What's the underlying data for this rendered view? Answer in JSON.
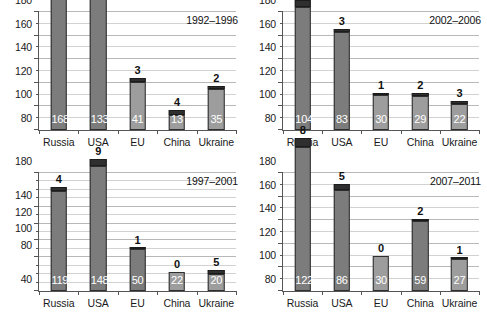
{
  "chart_data": {
    "type": "bar",
    "layout": "2x2 grid of stacked bar charts",
    "categories": [
      "Russia",
      "USA",
      "EU",
      "China",
      "Ukraine"
    ],
    "series_names": [
      "lower",
      "upper"
    ],
    "grid": true,
    "legend": "none",
    "panels": [
      {
        "id": "panel-tl",
        "title": "1992–1996",
        "position": "top-left",
        "ylim": [
          80,
          180
        ],
        "yticks": [
          80,
          100,
          120,
          140,
          160,
          180
        ],
        "ytick_labels": [
          "80",
          "100",
          "120",
          "140",
          "160",
          "180"
        ],
        "minor_step": 10,
        "bars": [
          {
            "category": "Russia",
            "lower": 168,
            "upper": 7,
            "total": 175,
            "light": false
          },
          {
            "category": "USA",
            "lower": 133,
            "upper": 11,
            "total": 144,
            "light": false
          },
          {
            "category": "EU",
            "lower": 41,
            "upper": 3,
            "total": 44,
            "light": true
          },
          {
            "category": "China",
            "lower": 13,
            "upper": 4,
            "total": 17,
            "light": true
          },
          {
            "category": "Ukraine",
            "lower": 35,
            "upper": 2,
            "total": 37,
            "light": true
          }
        ]
      },
      {
        "id": "panel-tr",
        "title": "2002–2006",
        "position": "top-right",
        "ylim": [
          80,
          180
        ],
        "yticks": [
          80,
          100,
          120,
          140,
          160,
          180
        ],
        "ytick_labels": [
          "80",
          "100",
          "120",
          "140",
          "160",
          "180"
        ],
        "minor_step": 10,
        "bars": [
          {
            "category": "Russia",
            "lower": 104,
            "upper": 6,
            "total": 110,
            "light": false
          },
          {
            "category": "USA",
            "lower": 83,
            "upper": 3,
            "total": 86,
            "light": false
          },
          {
            "category": "EU",
            "lower": 30,
            "upper": 1,
            "total": 31,
            "light": true
          },
          {
            "category": "China",
            "lower": 29,
            "upper": 2,
            "total": 31,
            "light": true
          },
          {
            "category": "Ukraine",
            "lower": 22,
            "upper": 3,
            "total": 25,
            "light": true
          }
        ]
      },
      {
        "id": "panel-bl",
        "title": "1997–2001",
        "position": "bottom-left",
        "ylim": [
          40,
          180
        ],
        "yticks": [
          40,
          80,
          100,
          120,
          140,
          180
        ],
        "ytick_labels": [
          "40",
          "80",
          "100",
          "120",
          "140",
          "180"
        ],
        "minor_step": 10,
        "bars": [
          {
            "category": "Russia",
            "lower": 119,
            "upper": 4,
            "total": 123,
            "light": false
          },
          {
            "category": "USA",
            "lower": 148,
            "upper": 9,
            "total": 157,
            "light": false
          },
          {
            "category": "EU",
            "lower": 50,
            "upper": 1,
            "total": 51,
            "light": false
          },
          {
            "category": "China",
            "lower": 22,
            "upper": 0,
            "total": 22,
            "light": true
          },
          {
            "category": "Ukraine",
            "lower": 20,
            "upper": 5,
            "total": 25,
            "light": true
          }
        ]
      },
      {
        "id": "panel-br",
        "title": "2007–2011",
        "position": "bottom-right",
        "ylim": [
          80,
          180
        ],
        "yticks": [
          80,
          100,
          120,
          140,
          160,
          180
        ],
        "ytick_labels": [
          "80",
          "100",
          "120",
          "140",
          "160",
          "180"
        ],
        "minor_step": 10,
        "bars": [
          {
            "category": "Russia",
            "lower": 122,
            "upper": 8,
            "total": 130,
            "light": false
          },
          {
            "category": "USA",
            "lower": 86,
            "upper": 5,
            "total": 91,
            "light": false
          },
          {
            "category": "EU",
            "lower": 30,
            "upper": 0,
            "total": 30,
            "light": true
          },
          {
            "category": "China",
            "lower": 59,
            "upper": 2,
            "total": 61,
            "light": false
          },
          {
            "category": "Ukraine",
            "lower": 27,
            "upper": 1,
            "total": 28,
            "light": true
          }
        ]
      }
    ],
    "colors": {
      "lower_segment": "#7c7c7c",
      "lower_segment_light": "#9d9d9d",
      "upper_segment": "#2f2f2f",
      "gridline": "#b8b8b8",
      "axis": "#555555",
      "inside_label": "#ffffff",
      "above_label": "#111111",
      "background": "#ffffff"
    }
  }
}
